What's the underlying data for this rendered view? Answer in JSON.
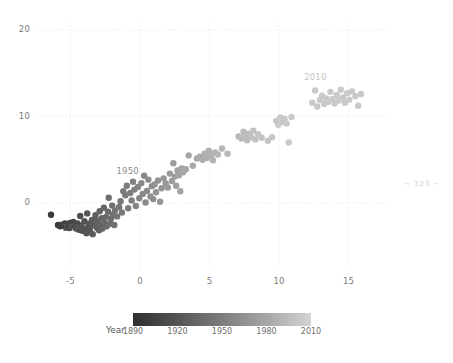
{
  "page": {
    "width": 453,
    "height": 363,
    "background": "#ffffff",
    "page_number_mark": "~ 323 ~"
  },
  "colors": {
    "point_dark": "#3b3b3b",
    "point_light": "#c9c9c9",
    "grid": "#e8e8e8",
    "tick_text": "#7a7a7a",
    "annotation_1890": "#5e5e5e",
    "annotation_1950": "#8c8c8c",
    "annotation_2010": "#c2c2c2",
    "colorbar_start": "#2f2f2f",
    "colorbar_end": "#d4d4d4"
  },
  "axes": {
    "x_ticks": [
      "-5",
      "0",
      "5",
      "10",
      "15"
    ],
    "x_tick_values": [
      -5,
      0,
      5,
      10,
      15
    ],
    "y_ticks": [
      "20",
      "10",
      "0"
    ],
    "y_tick_values": [
      20,
      10,
      0
    ],
    "xlabel": "",
    "ylabel": "",
    "xlim": [
      -7.5,
      17.8
    ],
    "ylim": [
      -4.3,
      21.5
    ],
    "grid": true
  },
  "annotations": [
    {
      "text": "1890",
      "x": -4.8,
      "y": -3.0,
      "color": "#5e5e5e"
    },
    {
      "text": "1950",
      "x": -0.9,
      "y": 3.6,
      "color": "#8c8c8c"
    },
    {
      "text": "2010",
      "x": 12.6,
      "y": 14.4,
      "color": "#c2c2c2"
    }
  ],
  "colorbar": {
    "title": "Year",
    "ticks": [
      "1890",
      "1920",
      "1950",
      "1980",
      "2010"
    ],
    "tick_values": [
      1890,
      1920,
      1950,
      1980,
      2010
    ],
    "vmin": 1890,
    "vmax": 2010,
    "orientation": "horizontal"
  },
  "chart_data": {
    "type": "scatter",
    "title": "",
    "xlabel": "",
    "ylabel": "",
    "xlim": [
      -7.5,
      17.8
    ],
    "ylim": [
      -4.3,
      21.5
    ],
    "grid": true,
    "colormap": "gray_dark_to_light",
    "color_variable": "Year",
    "color_range": [
      1890,
      2010
    ],
    "legend_position": "bottom-colorbar",
    "marker_size_px": 3.2,
    "points": [
      {
        "x": -6.4,
        "y": -1.35,
        "year": 1890
      },
      {
        "x": -5.9,
        "y": -2.55,
        "year": 1891
      },
      {
        "x": -5.75,
        "y": -2.7,
        "year": 1892
      },
      {
        "x": -5.6,
        "y": -2.5,
        "year": 1893
      },
      {
        "x": -5.5,
        "y": -2.62,
        "year": 1894
      },
      {
        "x": -5.4,
        "y": -2.35,
        "year": 1895
      },
      {
        "x": -5.35,
        "y": -2.78,
        "year": 1896
      },
      {
        "x": -5.2,
        "y": -2.45,
        "year": 1897
      },
      {
        "x": -5.1,
        "y": -2.9,
        "year": 1898
      },
      {
        "x": -5.05,
        "y": -2.3,
        "year": 1899
      },
      {
        "x": -4.95,
        "y": -2.6,
        "year": 1900
      },
      {
        "x": -4.8,
        "y": -2.2,
        "year": 1901
      },
      {
        "x": -4.7,
        "y": -2.5,
        "year": 1902
      },
      {
        "x": -4.6,
        "y": -2.95,
        "year": 1903
      },
      {
        "x": -4.5,
        "y": -2.35,
        "year": 1904
      },
      {
        "x": -4.4,
        "y": -3.1,
        "year": 1905
      },
      {
        "x": -4.3,
        "y": -1.5,
        "year": 1906
      },
      {
        "x": -4.2,
        "y": -2.6,
        "year": 1907
      },
      {
        "x": -4.15,
        "y": -3.2,
        "year": 1908
      },
      {
        "x": -4.0,
        "y": -2.1,
        "year": 1909
      },
      {
        "x": -3.9,
        "y": -3.0,
        "year": 1910
      },
      {
        "x": -3.85,
        "y": -3.5,
        "year": 1911
      },
      {
        "x": -3.8,
        "y": -1.2,
        "year": 1912
      },
      {
        "x": -3.7,
        "y": -2.4,
        "year": 1913
      },
      {
        "x": -3.6,
        "y": -3.3,
        "year": 1914
      },
      {
        "x": -3.55,
        "y": -2.75,
        "year": 1915
      },
      {
        "x": -3.45,
        "y": -1.95,
        "year": 1916
      },
      {
        "x": -3.4,
        "y": -3.6,
        "year": 1917
      },
      {
        "x": -3.3,
        "y": -2.3,
        "year": 1918
      },
      {
        "x": -3.2,
        "y": -1.4,
        "year": 1919
      },
      {
        "x": -3.1,
        "y": -2.85,
        "year": 1920
      },
      {
        "x": -3.05,
        "y": -2.05,
        "year": 1921
      },
      {
        "x": -2.95,
        "y": -3.15,
        "year": 1922
      },
      {
        "x": -2.9,
        "y": -0.95,
        "year": 1923
      },
      {
        "x": -2.85,
        "y": -2.5,
        "year": 1924
      },
      {
        "x": -2.75,
        "y": -1.75,
        "year": 1925
      },
      {
        "x": -2.7,
        "y": -2.95,
        "year": 1926
      },
      {
        "x": -2.6,
        "y": -0.55,
        "year": 1927
      },
      {
        "x": -2.55,
        "y": -2.25,
        "year": 1928
      },
      {
        "x": -2.45,
        "y": -1.6,
        "year": 1929
      },
      {
        "x": -2.4,
        "y": -2.7,
        "year": 1930
      },
      {
        "x": -2.3,
        "y": -1.0,
        "year": 1931
      },
      {
        "x": -2.25,
        "y": 0.6,
        "year": 1932
      },
      {
        "x": -2.15,
        "y": -2.4,
        "year": 1933
      },
      {
        "x": -2.1,
        "y": -1.85,
        "year": 1934
      },
      {
        "x": -2.0,
        "y": -0.3,
        "year": 1935
      },
      {
        "x": -1.95,
        "y": -1.35,
        "year": 1936
      },
      {
        "x": -1.85,
        "y": -2.55,
        "year": 1937
      },
      {
        "x": -1.8,
        "y": -0.85,
        "year": 1938
      },
      {
        "x": -1.65,
        "y": -1.55,
        "year": 1939
      },
      {
        "x": -1.5,
        "y": -0.45,
        "year": 1940
      },
      {
        "x": -1.4,
        "y": 0.2,
        "year": 1941
      },
      {
        "x": -1.3,
        "y": -1.1,
        "year": 1942
      },
      {
        "x": -1.2,
        "y": 1.35,
        "year": 1943
      },
      {
        "x": -1.05,
        "y": 0.9,
        "year": 1944
      },
      {
        "x": -0.95,
        "y": 2.0,
        "year": 1945
      },
      {
        "x": -0.85,
        "y": -0.6,
        "year": 1946
      },
      {
        "x": -0.7,
        "y": 1.15,
        "year": 1947
      },
      {
        "x": -0.6,
        "y": 0.3,
        "year": 1948
      },
      {
        "x": -0.5,
        "y": 2.45,
        "year": 1949
      },
      {
        "x": -0.4,
        "y": 1.55,
        "year": 1950
      },
      {
        "x": -0.3,
        "y": -0.35,
        "year": 1951
      },
      {
        "x": -0.15,
        "y": 1.85,
        "year": 1952
      },
      {
        "x": -0.05,
        "y": 0.55,
        "year": 1953
      },
      {
        "x": 0.1,
        "y": 2.3,
        "year": 1954
      },
      {
        "x": 0.2,
        "y": 1.05,
        "year": 1955
      },
      {
        "x": 0.3,
        "y": 3.15,
        "year": 1956
      },
      {
        "x": 0.4,
        "y": 0.05,
        "year": 1957
      },
      {
        "x": 0.5,
        "y": 1.4,
        "year": 1958
      },
      {
        "x": 0.6,
        "y": 2.7,
        "year": 1959
      },
      {
        "x": 0.75,
        "y": 0.75,
        "year": 1960
      },
      {
        "x": 0.85,
        "y": 1.95,
        "year": 1961
      },
      {
        "x": 0.95,
        "y": 0.45,
        "year": 1962
      },
      {
        "x": 1.05,
        "y": 2.15,
        "year": 1963
      },
      {
        "x": 1.15,
        "y": 1.25,
        "year": 1964
      },
      {
        "x": 1.3,
        "y": 2.6,
        "year": 1965
      },
      {
        "x": 1.45,
        "y": 0.15,
        "year": 1966
      },
      {
        "x": 1.55,
        "y": 1.7,
        "year": 1967
      },
      {
        "x": 1.7,
        "y": 2.85,
        "year": 1968
      },
      {
        "x": 1.85,
        "y": 2.25,
        "year": 1969
      },
      {
        "x": 2.0,
        "y": 1.8,
        "year": 1970
      },
      {
        "x": 2.15,
        "y": 3.4,
        "year": 1971
      },
      {
        "x": 2.3,
        "y": 2.55,
        "year": 1972
      },
      {
        "x": 2.4,
        "y": 4.6,
        "year": 1973
      },
      {
        "x": 2.5,
        "y": 3.05,
        "year": 1974
      },
      {
        "x": 2.6,
        "y": 2.0,
        "year": 1975
      },
      {
        "x": 2.7,
        "y": 3.75,
        "year": 1976
      },
      {
        "x": 2.8,
        "y": 3.2,
        "year": 1977
      },
      {
        "x": 2.9,
        "y": 1.35,
        "year": 1978
      },
      {
        "x": 3.0,
        "y": 4.0,
        "year": 1979
      },
      {
        "x": 3.1,
        "y": 3.55,
        "year": 1980
      },
      {
        "x": 3.3,
        "y": 3.9,
        "year": 1981
      },
      {
        "x": 3.5,
        "y": 5.5,
        "year": 1982
      },
      {
        "x": 3.8,
        "y": 4.3,
        "year": 1983
      },
      {
        "x": 4.1,
        "y": 5.15,
        "year": 1984
      },
      {
        "x": 4.3,
        "y": 5.35,
        "year": 1985
      },
      {
        "x": 4.5,
        "y": 5.0,
        "year": 1986
      },
      {
        "x": 4.65,
        "y": 5.7,
        "year": 1987
      },
      {
        "x": 4.8,
        "y": 5.2,
        "year": 1988
      },
      {
        "x": 4.95,
        "y": 6.05,
        "year": 1989
      },
      {
        "x": 5.1,
        "y": 5.45,
        "year": 1990
      },
      {
        "x": 5.25,
        "y": 4.95,
        "year": 1991
      },
      {
        "x": 5.4,
        "y": 5.85,
        "year": 1992
      },
      {
        "x": 5.6,
        "y": 5.6,
        "year": 1993
      },
      {
        "x": 5.9,
        "y": 6.3,
        "year": 1994
      },
      {
        "x": 6.3,
        "y": 5.7,
        "year": 1995
      },
      {
        "x": 7.1,
        "y": 7.7,
        "year": 1996
      },
      {
        "x": 7.3,
        "y": 7.45,
        "year": 1997
      },
      {
        "x": 7.45,
        "y": 8.25,
        "year": 1998
      },
      {
        "x": 7.6,
        "y": 7.85,
        "year": 1999
      },
      {
        "x": 7.7,
        "y": 7.25,
        "year": 2000
      },
      {
        "x": 7.85,
        "y": 8.0,
        "year": 2001
      },
      {
        "x": 8.0,
        "y": 7.6,
        "year": 2002
      },
      {
        "x": 8.15,
        "y": 8.35,
        "year": 2003
      },
      {
        "x": 8.3,
        "y": 7.35,
        "year": 2004
      },
      {
        "x": 8.5,
        "y": 7.95,
        "year": 2005
      },
      {
        "x": 8.75,
        "y": 7.55,
        "year": 2006
      },
      {
        "x": 9.2,
        "y": 7.2,
        "year": 2007
      },
      {
        "x": 9.5,
        "y": 7.6,
        "year": 2008
      },
      {
        "x": 9.8,
        "y": 9.5,
        "year": 2009
      },
      {
        "x": 9.95,
        "y": 9.05,
        "year": 2010
      },
      {
        "x": 10.1,
        "y": 9.9,
        "year": 2010
      },
      {
        "x": 10.25,
        "y": 9.35,
        "year": 2010
      },
      {
        "x": 10.4,
        "y": 9.75,
        "year": 2010
      },
      {
        "x": 10.55,
        "y": 9.2,
        "year": 2010
      },
      {
        "x": 10.7,
        "y": 7.0,
        "year": 2010
      },
      {
        "x": 10.9,
        "y": 9.95,
        "year": 2010
      },
      {
        "x": 12.4,
        "y": 11.6,
        "year": 2010
      },
      {
        "x": 12.6,
        "y": 13.0,
        "year": 2010
      },
      {
        "x": 12.75,
        "y": 11.15,
        "year": 2010
      },
      {
        "x": 12.95,
        "y": 11.9,
        "year": 2010
      },
      {
        "x": 13.1,
        "y": 12.4,
        "year": 2010
      },
      {
        "x": 13.25,
        "y": 11.45,
        "year": 2010
      },
      {
        "x": 13.4,
        "y": 12.1,
        "year": 2010
      },
      {
        "x": 13.55,
        "y": 11.7,
        "year": 2010
      },
      {
        "x": 13.7,
        "y": 12.85,
        "year": 2010
      },
      {
        "x": 13.85,
        "y": 12.0,
        "year": 2010
      },
      {
        "x": 14.0,
        "y": 11.5,
        "year": 2010
      },
      {
        "x": 14.15,
        "y": 12.5,
        "year": 2010
      },
      {
        "x": 14.3,
        "y": 11.85,
        "year": 2010
      },
      {
        "x": 14.45,
        "y": 13.1,
        "year": 2010
      },
      {
        "x": 14.6,
        "y": 12.2,
        "year": 2010
      },
      {
        "x": 14.75,
        "y": 11.6,
        "year": 2010
      },
      {
        "x": 14.9,
        "y": 12.7,
        "year": 2010
      },
      {
        "x": 15.05,
        "y": 11.95,
        "year": 2010
      },
      {
        "x": 15.25,
        "y": 12.9,
        "year": 2010
      },
      {
        "x": 15.5,
        "y": 12.35,
        "year": 2010
      },
      {
        "x": 15.7,
        "y": 11.25,
        "year": 2010
      },
      {
        "x": 15.9,
        "y": 12.6,
        "year": 2010
      }
    ]
  }
}
